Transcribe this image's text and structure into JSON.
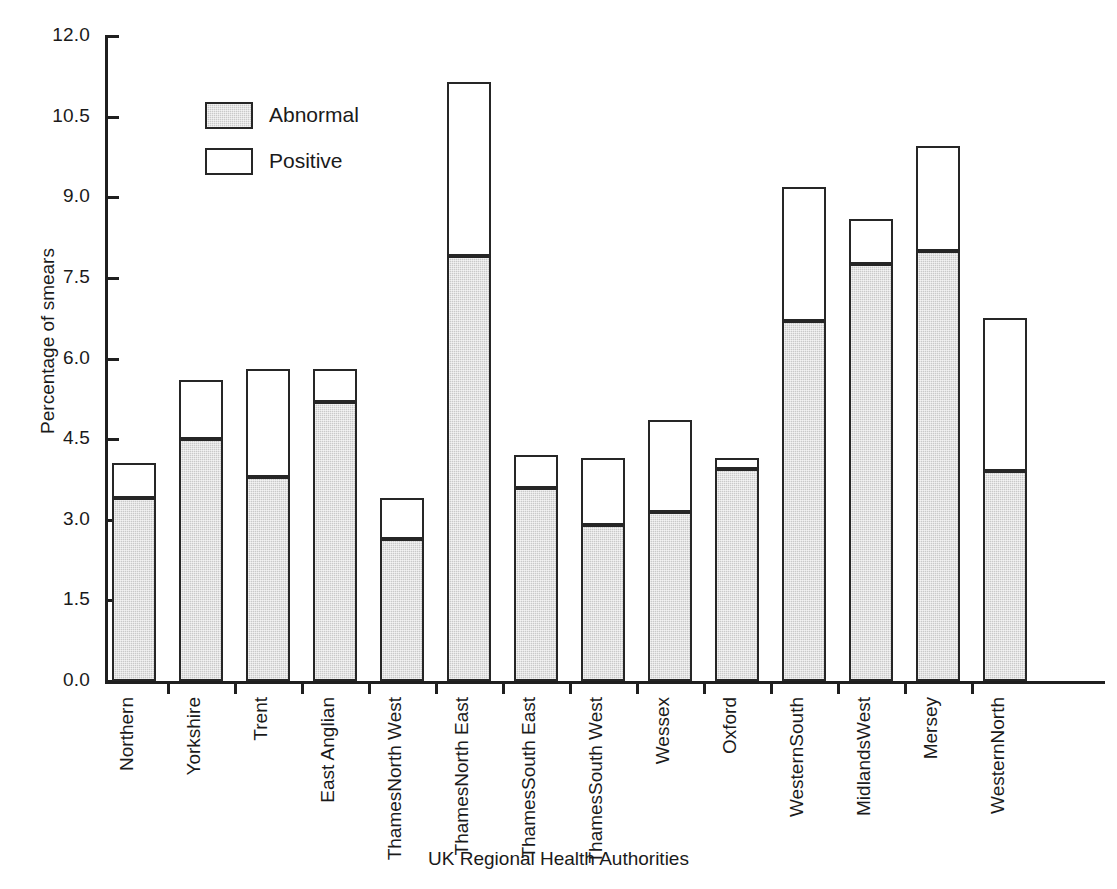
{
  "chart_data": {
    "type": "bar",
    "subtype": "stacked-vertical",
    "title": "",
    "xlabel": "UK Regional Health Authorities",
    "ylabel": "Percentage of smears",
    "ylim": [
      0.0,
      12.0
    ],
    "ytick_step": 1.5,
    "ytick_labels": [
      "0.0",
      "1.5",
      "3.0",
      "4.5",
      "6.0",
      "7.5",
      "9.0",
      "10.5",
      "12.0"
    ],
    "ytick_values": [
      0.0,
      1.5,
      3.0,
      4.5,
      6.0,
      7.5,
      9.0,
      10.5,
      12.0
    ],
    "grid": false,
    "legend_position": "upper-left-inside",
    "categories": [
      "Northern",
      "Yorkshire",
      "Trent",
      "East Anglian",
      "North West Thames",
      "North East Thames",
      "South East Thames",
      "South West Thames",
      "Wessex",
      "Oxford",
      "South Western",
      "West Midlands",
      "Mersey",
      "North Western"
    ],
    "category_label_lines": [
      [
        "Northern"
      ],
      [
        "Yorkshire"
      ],
      [
        "Trent"
      ],
      [
        "East Anglian"
      ],
      [
        "North West",
        "Thames"
      ],
      [
        "North East",
        "Thames"
      ],
      [
        "South East",
        "Thames"
      ],
      [
        "South West",
        "Thames"
      ],
      [
        "Wessex"
      ],
      [
        "Oxford"
      ],
      [
        "South",
        "Western"
      ],
      [
        "West",
        "Midlands"
      ],
      [
        "Mersey"
      ],
      [
        "North",
        "Western"
      ]
    ],
    "series": [
      {
        "name": "Abnormal",
        "color": "#c9c9c9",
        "values": [
          3.4,
          4.5,
          3.8,
          5.2,
          2.65,
          7.9,
          3.6,
          2.9,
          3.15,
          3.95,
          6.7,
          7.75,
          8.0,
          3.9
        ]
      },
      {
        "name": "Positive",
        "color": "#ffffff",
        "values": [
          0.65,
          1.1,
          2.0,
          0.6,
          0.75,
          3.25,
          0.6,
          1.25,
          1.7,
          0.2,
          2.5,
          0.85,
          1.95,
          2.85
        ]
      }
    ],
    "totals": [
      4.05,
      5.6,
      5.8,
      5.8,
      3.4,
      11.15,
      4.2,
      4.15,
      4.85,
      4.15,
      9.2,
      8.6,
      9.95,
      6.75
    ],
    "legend": [
      {
        "label": "Abnormal",
        "swatch": "abnormal"
      },
      {
        "label": "Positive",
        "swatch": "positive"
      }
    ]
  },
  "geometry": {
    "baseline_y": 681,
    "top_y": 36,
    "px_per_unit": 53.75,
    "first_bar_left": 112,
    "bar_width": 44,
    "bar_pitch": 67
  }
}
